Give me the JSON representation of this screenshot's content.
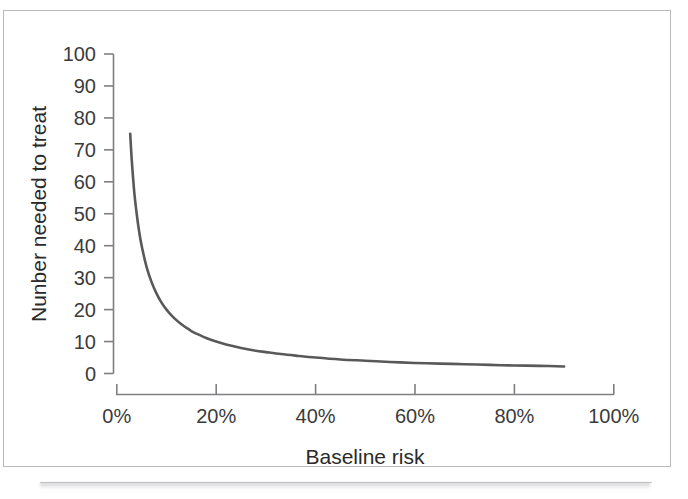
{
  "figure": {
    "background_color": "#ffffff",
    "frame_border_color": "#b9b9bc"
  },
  "chart_data": {
    "type": "line",
    "title": "",
    "subtitle": "",
    "xlabel": "Baseline risk",
    "ylabel": "Nunber needed to treat",
    "xlim": [
      0,
      100
    ],
    "ylim": [
      0,
      100
    ],
    "xtick_labels": [
      "0%",
      "20%",
      "40%",
      "60%",
      "80%",
      "100%"
    ],
    "xtick_values": [
      0,
      20,
      40,
      60,
      80,
      100
    ],
    "ytick_labels": [
      "0",
      "10",
      "20",
      "30",
      "40",
      "50",
      "60",
      "70",
      "80",
      "90",
      "100"
    ],
    "ytick_values": [
      0,
      10,
      20,
      30,
      40,
      50,
      60,
      70,
      80,
      90,
      100
    ],
    "grid": false,
    "legend": false,
    "legend_position": "none",
    "line_color": "#595959",
    "axis_color": "#7f7f83",
    "series": [
      {
        "name": "Number needed to treat",
        "x": [
          2.7,
          3.0,
          3.5,
          4.0,
          4.5,
          5.0,
          6.0,
          7.0,
          8.0,
          9.0,
          10.0,
          11.0,
          12.0,
          13.0,
          14.0,
          15.0,
          16.0,
          18.0,
          20.0,
          22.0,
          25.0,
          28.0,
          30.0,
          33.0,
          36.0,
          40.0,
          45.0,
          50.0,
          55.0,
          60.0,
          65.0,
          70.0,
          75.0,
          80.0,
          85.0,
          90.0
        ],
        "y": [
          75.0,
          67.0,
          57.0,
          50.0,
          44.4,
          40.0,
          33.3,
          28.6,
          25.0,
          22.2,
          20.0,
          18.2,
          16.7,
          15.4,
          14.3,
          13.3,
          12.5,
          11.1,
          10.0,
          9.1,
          8.0,
          7.1,
          6.7,
          6.1,
          5.6,
          5.0,
          4.4,
          4.0,
          3.6,
          3.3,
          3.1,
          2.9,
          2.7,
          2.5,
          2.4,
          2.2
        ]
      }
    ],
    "annotations": [],
    "note": "Curve follows NNT = 200 / baseline risk percent (absolute risk reduction of 2 percentage points), drawn from about 2.7% to 90% baseline risk."
  }
}
